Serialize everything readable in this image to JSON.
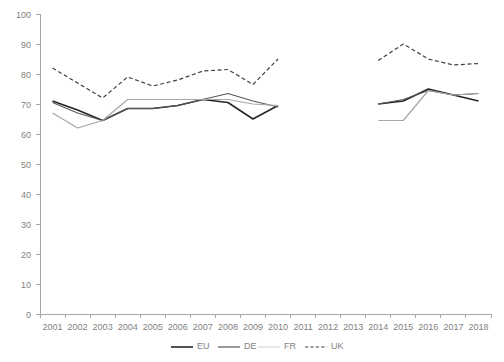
{
  "chart_data": {
    "type": "line",
    "title": "",
    "subtitle": "",
    "xlabel": "",
    "ylabel": "",
    "xlim_categories": [
      "2001",
      "2002",
      "2003",
      "2004",
      "2005",
      "2006",
      "2007",
      "2008",
      "2009",
      "2010",
      "2011",
      "2012",
      "2013",
      "2014",
      "2015",
      "2016",
      "2017",
      "2018"
    ],
    "ylim": [
      0,
      100
    ],
    "ytick_step": 10,
    "grid": false,
    "legend_position": "bottom",
    "note": "Data series are interrupted: values present for 2001-2010 and 2014-2018; no data for 2011-2013",
    "categories": [
      "2001",
      "2002",
      "2003",
      "2004",
      "2005",
      "2006",
      "2007",
      "2008",
      "2009",
      "2010",
      "2011",
      "2012",
      "2013",
      "2014",
      "2015",
      "2016",
      "2017",
      "2018"
    ],
    "yticks": [
      0,
      10,
      20,
      30,
      40,
      50,
      60,
      70,
      80,
      90,
      100
    ],
    "series": [
      {
        "name": "EU",
        "color": "#262626",
        "style": "solid",
        "width": 1.6,
        "values": [
          71,
          68,
          64.5,
          68.5,
          68.5,
          69.5,
          71.5,
          70.5,
          65,
          69.5,
          null,
          null,
          null,
          70,
          71,
          75,
          73,
          71
        ]
      },
      {
        "name": "DE",
        "color": "#595959",
        "style": "solid",
        "width": 1.2,
        "values": [
          70.5,
          67,
          64.5,
          68.5,
          68.5,
          69.5,
          71.5,
          73.5,
          71,
          69,
          null,
          null,
          null,
          70,
          71.5,
          74.5,
          73,
          73.5
        ]
      },
      {
        "name": "FR",
        "color": "#a6a6a6",
        "style": "solid",
        "width": 1.2,
        "values": [
          67,
          62,
          64.5,
          71.5,
          71.5,
          71.5,
          71.5,
          71.5,
          70,
          69.5,
          null,
          null,
          null,
          64.5,
          64.5,
          74.5,
          73,
          73.5
        ]
      },
      {
        "name": "UK",
        "color": "#404040",
        "style": "dashed",
        "width": 1.2,
        "values": [
          82,
          77,
          72,
          79,
          76,
          78,
          81,
          81.5,
          76.5,
          85,
          null,
          null,
          null,
          84.5,
          90,
          85,
          83,
          83.5
        ]
      }
    ]
  },
  "legend": {
    "items": [
      {
        "label": "EU"
      },
      {
        "label": "DE"
      },
      {
        "label": "FR"
      },
      {
        "label": "UK"
      }
    ]
  }
}
